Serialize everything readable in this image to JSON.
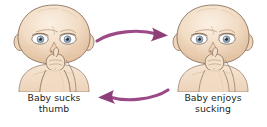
{
  "figure": {
    "background_color": "#ffffff",
    "text_color": "#231f20"
  },
  "nodes": [
    {
      "id": "baby-sucks-thumb",
      "caption_line1": "Baby sucks",
      "caption_line2": "thumb",
      "illustration": "baby-sucking-thumb-illustration",
      "skin_color": "#f0dcc6",
      "skin_shadow": "#e0c3a6",
      "outline_color": "#8c7260",
      "eye_color": "#8fa4b8"
    },
    {
      "id": "baby-enjoys-sucking",
      "caption_line1": "Baby enjoys",
      "caption_line2": "sucking",
      "illustration": "baby-sucking-thumb-illustration",
      "skin_color": "#f0dcc6",
      "skin_shadow": "#e0c3a6",
      "outline_color": "#8c7260",
      "eye_color": "#8fa4b8"
    }
  ],
  "arrows": [
    {
      "id": "arrow-top",
      "name": "arrow-right",
      "direction": "right",
      "from": "baby-sucks-thumb",
      "to": "baby-enjoys-sucking",
      "color": "#9c4a86"
    },
    {
      "id": "arrow-bottom",
      "name": "arrow-left",
      "direction": "left",
      "from": "baby-enjoys-sucking",
      "to": "baby-sucks-thumb",
      "color": "#9c4a86"
    }
  ]
}
